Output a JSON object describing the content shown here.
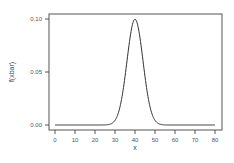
{
  "chart_data": {
    "type": "line",
    "title": "",
    "xlabel": "x",
    "ylabel": "f(xbar)",
    "xlim": [
      0,
      80
    ],
    "ylim": [
      0.0,
      0.1
    ],
    "grid": false,
    "legend": null,
    "x_ticks": [
      0,
      10,
      20,
      30,
      40,
      50,
      60,
      70,
      80
    ],
    "x_tick_labels": [
      "0",
      "10",
      "20",
      "30",
      "40",
      "50",
      "60",
      "70",
      "80"
    ],
    "y_ticks": [
      0.0,
      0.05,
      0.1
    ],
    "y_tick_labels": [
      "0.00",
      "0.05",
      "0.10"
    ],
    "series": [
      {
        "name": "f(xbar)",
        "distribution": "normal",
        "mean": 40,
        "sd": 4,
        "x": [
          0,
          10,
          20,
          25,
          28,
          30,
          32,
          34,
          36,
          38,
          40,
          42,
          44,
          46,
          48,
          50,
          52,
          55,
          60,
          70,
          80
        ],
        "values": [
          0.0,
          0.0,
          0.0,
          0.0001,
          0.0011,
          0.0044,
          0.0135,
          0.0324,
          0.0605,
          0.088,
          0.0997,
          0.088,
          0.0605,
          0.0324,
          0.0135,
          0.0044,
          0.0011,
          0.0001,
          0.0,
          0.0,
          0.0
        ]
      }
    ],
    "line_color": "#333333"
  }
}
